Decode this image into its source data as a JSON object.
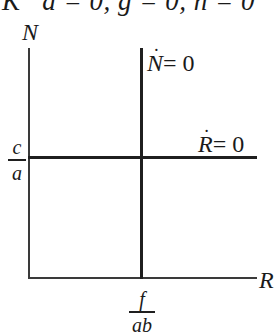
{
  "header": {
    "cropped_title": "K   a = 0, g = 0, h = 0"
  },
  "diagram": {
    "type": "phase-plane nullcline diagram",
    "y_axis_label": "N",
    "x_axis_label": "R",
    "nullclines": [
      {
        "name": "N-dot nullcline",
        "var": "N",
        "rhs": "= 0",
        "orientation": "vertical",
        "position_label": {
          "numerator": "f",
          "denominator": "ab"
        }
      },
      {
        "name": "R-dot nullcline",
        "var": "R",
        "rhs": "= 0",
        "orientation": "horizontal",
        "position_label": {
          "numerator": "c",
          "denominator": "a"
        }
      }
    ],
    "colors": {
      "line": "#1f1f1f",
      "background": "#ffffff"
    }
  }
}
